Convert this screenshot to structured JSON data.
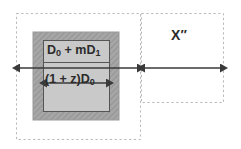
{
  "diagram": {
    "background_color": "#ffffff",
    "outer_box_fill": "#a8a8a8",
    "inner_box_fill": "#c9c9c9",
    "line_color": "#3a3a3a",
    "dashed_color": "#b5b5b5",
    "text_color": "#2b2b2b"
  },
  "regions": {
    "left_region": {
      "name": "left-dashed-region",
      "x": 16,
      "y": 13,
      "width": 125,
      "height": 127
    },
    "right_region": {
      "name": "right-dashed-region",
      "x": 141,
      "y": 13,
      "width": 83,
      "height": 90
    }
  },
  "boxes": {
    "outer": {
      "name": "hatched-outer-box",
      "x": 33,
      "y": 32,
      "width": 86,
      "height": 88,
      "fill": "#a8a8a8"
    },
    "inner": {
      "name": "inner-labeled-box",
      "x": 43,
      "y": 40,
      "width": 67,
      "height": 72,
      "fill": "#c9c9c9",
      "divider_y": 62
    }
  },
  "labels": {
    "top_cell": "D₀ + mD₁",
    "bottom_cell": "(1 + z)D₀",
    "right_measure": "X″"
  },
  "label_parts": {
    "top_cell_plain": "D0 + mD1",
    "bottom_cell_plain": "(1 + z)D0",
    "right_measure_plain": "X''"
  },
  "arrows": {
    "outer_span": {
      "name": "outer-span-arrow",
      "y": 68,
      "x1": 18,
      "x2": 139,
      "double_headed": true
    },
    "inner_span": {
      "name": "inner-span-arrow",
      "y": 83,
      "x1": 45,
      "x2": 108,
      "double_headed": true
    },
    "right_span": {
      "name": "right-span-arrow",
      "y": 68,
      "x1": 143,
      "x2": 222,
      "double_headed": true
    }
  }
}
